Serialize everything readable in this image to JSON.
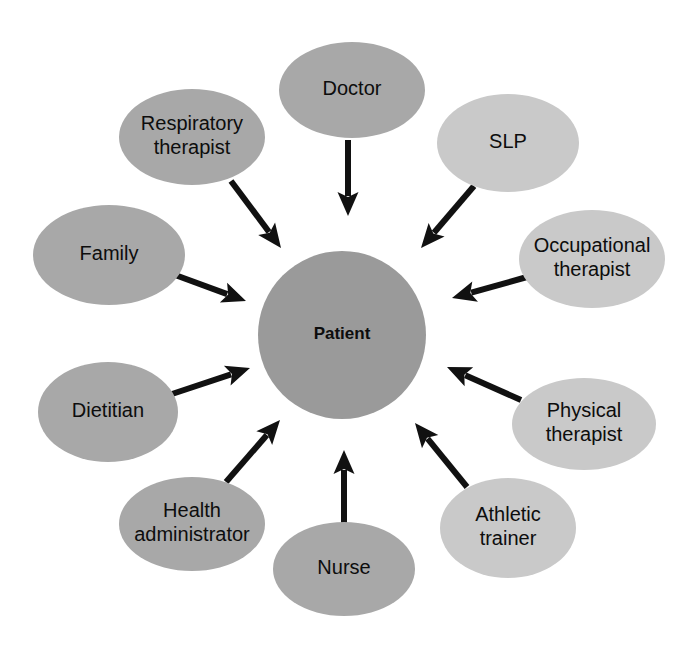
{
  "diagram": {
    "type": "hub-and-spoke-diagram",
    "background_color": "#ffffff",
    "colors": {
      "hub_fill": "#9a9a9a",
      "dark_node_fill": "#a8a8a8",
      "light_node_fill": "#c9c9c9",
      "arrow_color": "#111111",
      "text_color": "#0d0d0d"
    },
    "center": {
      "id": "patient",
      "label": "Patient",
      "shape": "circle",
      "cx": 342,
      "cy": 335,
      "r": 84,
      "fill": "#9a9a9a",
      "bold": true
    },
    "nodes": [
      {
        "id": "doctor",
        "label": "Doctor",
        "lines": [
          "Doctor"
        ],
        "cx": 352,
        "cy": 90,
        "rx": 73,
        "ry": 48,
        "fill": "#a8a8a8"
      },
      {
        "id": "respiratory-therapist",
        "label": "Respiratory therapist",
        "lines": [
          "Respiratory",
          "therapist"
        ],
        "cx": 192,
        "cy": 137,
        "rx": 73,
        "ry": 48,
        "fill": "#a8a8a8"
      },
      {
        "id": "slp",
        "label": "SLP",
        "lines": [
          "SLP"
        ],
        "cx": 508,
        "cy": 143,
        "rx": 71,
        "ry": 49,
        "fill": "#c9c9c9"
      },
      {
        "id": "family",
        "label": "Family",
        "lines": [
          "Family"
        ],
        "cx": 109,
        "cy": 255,
        "rx": 76,
        "ry": 50,
        "fill": "#a8a8a8"
      },
      {
        "id": "occupational-therapist",
        "label": "Occupational therapist",
        "lines": [
          "Occupational",
          "therapist"
        ],
        "cx": 592,
        "cy": 259,
        "rx": 73,
        "ry": 49,
        "fill": "#c9c9c9"
      },
      {
        "id": "dietitian",
        "label": "Dietitian",
        "lines": [
          "Dietitian"
        ],
        "cx": 108,
        "cy": 412,
        "rx": 70,
        "ry": 50,
        "fill": "#a8a8a8"
      },
      {
        "id": "physical-therapist",
        "label": "Physical therapist",
        "lines": [
          "Physical",
          "therapist"
        ],
        "cx": 584,
        "cy": 424,
        "rx": 72,
        "ry": 46,
        "fill": "#c9c9c9"
      },
      {
        "id": "health-administrator",
        "label": "Health administrator",
        "lines": [
          "Health",
          "administrator"
        ],
        "cx": 192,
        "cy": 524,
        "rx": 73,
        "ry": 47,
        "fill": "#a8a8a8"
      },
      {
        "id": "athletic-trainer",
        "label": "Athletic trainer",
        "lines": [
          "Athletic",
          "trainer"
        ],
        "cx": 508,
        "cy": 528,
        "rx": 68,
        "ry": 50,
        "fill": "#c9c9c9"
      },
      {
        "id": "nurse",
        "label": "Nurse",
        "lines": [
          "Nurse"
        ],
        "cx": 344,
        "cy": 569,
        "rx": 71,
        "ry": 47,
        "fill": "#a8a8a8"
      }
    ],
    "arrows": [
      {
        "id": "arrow-doctor-to-patient",
        "from": "doctor",
        "to": "patient",
        "x1": 348,
        "y1": 140,
        "x2": 348,
        "y2": 216,
        "width": 6
      },
      {
        "id": "arrow-respiratory-therapist-to-patient",
        "from": "respiratory-therapist",
        "to": "patient",
        "x1": 231,
        "y1": 181,
        "x2": 281,
        "y2": 248,
        "width": 6
      },
      {
        "id": "arrow-slp-to-patient",
        "from": "slp",
        "to": "patient",
        "x1": 474,
        "y1": 186,
        "x2": 421,
        "y2": 248,
        "width": 6
      },
      {
        "id": "arrow-family-to-patient",
        "from": "family",
        "to": "patient",
        "x1": 167,
        "y1": 272,
        "x2": 246,
        "y2": 301,
        "width": 6
      },
      {
        "id": "arrow-occupational-therapist-to-patient",
        "from": "occupational-therapist",
        "to": "patient",
        "x1": 527,
        "y1": 277,
        "x2": 452,
        "y2": 298,
        "width": 6
      },
      {
        "id": "arrow-dietitian-to-patient",
        "from": "dietitian",
        "to": "patient",
        "x1": 172,
        "y1": 394,
        "x2": 250,
        "y2": 368,
        "width": 6
      },
      {
        "id": "arrow-physical-therapist-to-patient",
        "from": "physical-therapist",
        "to": "patient",
        "x1": 521,
        "y1": 400,
        "x2": 447,
        "y2": 367,
        "width": 6
      },
      {
        "id": "arrow-health-administrator-to-patient",
        "from": "health-administrator",
        "to": "patient",
        "x1": 226,
        "y1": 482,
        "x2": 280,
        "y2": 420,
        "width": 6
      },
      {
        "id": "arrow-athletic-trainer-to-patient",
        "from": "athletic-trainer",
        "to": "patient",
        "x1": 467,
        "y1": 487,
        "x2": 415,
        "y2": 423,
        "width": 6
      },
      {
        "id": "arrow-nurse-to-patient",
        "from": "nurse",
        "to": "patient",
        "x1": 344,
        "y1": 525,
        "x2": 344,
        "y2": 450,
        "width": 6
      }
    ]
  }
}
